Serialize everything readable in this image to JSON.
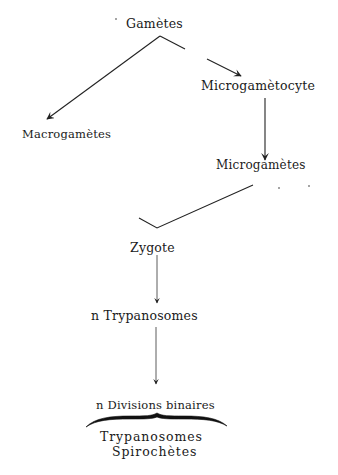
{
  "diagram": {
    "nodes": {
      "gametes": "Gamètes",
      "microgametocyte": "Microgamètocyte",
      "macrogametes": "Macrogamètes",
      "microgametes": "Microgamètes",
      "zygote": "Zygote",
      "n_trypanosomes": "n Trypanosomes",
      "n_divisions": "n Divisions binaires",
      "trypanosomes": "Trypanosomes",
      "spirochetes": "Spirochètes"
    },
    "edges": [
      {
        "from": "Gamètes",
        "to": "Macrogamètes"
      },
      {
        "from": "Gamètes",
        "to": "Microgamètocyte"
      },
      {
        "from": "Microgamètocyte",
        "to": "Microgamètes"
      },
      {
        "from": "Microgamètes",
        "to": "Zygote"
      },
      {
        "from": "Zygote",
        "to": "n Trypanosomes"
      },
      {
        "from": "n Trypanosomes",
        "to": "n Divisions binaires"
      }
    ],
    "brace_groups": [
      {
        "under": "n Divisions binaires",
        "items": [
          "Trypanosomes",
          "Spirochètes"
        ]
      }
    ]
  }
}
